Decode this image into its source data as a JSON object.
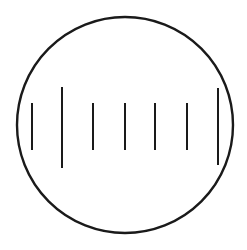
{
  "diagram": {
    "stroke_color": "#1a1a1a",
    "background": "#ffffff",
    "circle": {
      "cx": 125,
      "cy": 125,
      "r": 108,
      "stroke_width": 2.4
    },
    "lines": [
      {
        "x": 32,
        "y1": 103,
        "y2": 150,
        "type": "short"
      },
      {
        "x": 62,
        "y1": 87,
        "y2": 168,
        "type": "long"
      },
      {
        "x": 93,
        "y1": 103,
        "y2": 150,
        "type": "short"
      },
      {
        "x": 125,
        "y1": 103,
        "y2": 150,
        "type": "short"
      },
      {
        "x": 155,
        "y1": 103,
        "y2": 150,
        "type": "short"
      },
      {
        "x": 187,
        "y1": 103,
        "y2": 150,
        "type": "short"
      },
      {
        "x": 218,
        "y1": 88,
        "y2": 165,
        "type": "long"
      }
    ],
    "line_width": 2
  }
}
